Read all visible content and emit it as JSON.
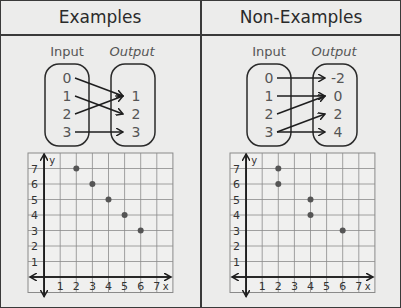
{
  "headers": {
    "left": "Examples",
    "right": "Non-Examples"
  },
  "mapping_labels": {
    "input": "Input",
    "output": "Output"
  },
  "examples": {
    "mapping": {
      "inputs": [
        "0",
        "1",
        "2",
        "3"
      ],
      "outputs": [
        "1",
        "2",
        "3"
      ],
      "arrows": [
        [
          "0",
          "1"
        ],
        [
          "1",
          "2"
        ],
        [
          "2",
          "1"
        ],
        [
          "3",
          "3"
        ]
      ]
    },
    "graph": {
      "x_ticks": [
        "1",
        "2",
        "3",
        "4",
        "5",
        "6",
        "7"
      ],
      "y_ticks": [
        "1",
        "2",
        "3",
        "4",
        "5",
        "6",
        "7"
      ],
      "x_label": "x",
      "y_label": "y",
      "points": [
        [
          2,
          7
        ],
        [
          3,
          6
        ],
        [
          4,
          5
        ],
        [
          5,
          4
        ],
        [
          6,
          3
        ]
      ]
    }
  },
  "non_examples": {
    "mapping": {
      "inputs": [
        "0",
        "1",
        "2",
        "3"
      ],
      "outputs": [
        "-2",
        "0",
        "2",
        "4"
      ],
      "arrows": [
        [
          "0",
          "-2"
        ],
        [
          "1",
          "0"
        ],
        [
          "2",
          "0"
        ],
        [
          "3",
          "2"
        ],
        [
          "3",
          "4"
        ]
      ]
    },
    "graph": {
      "x_ticks": [
        "1",
        "2",
        "3",
        "4",
        "5",
        "6",
        "7"
      ],
      "y_ticks": [
        "1",
        "2",
        "3",
        "4",
        "5",
        "6",
        "7"
      ],
      "x_label": "x",
      "y_label": "y",
      "points": [
        [
          2,
          7
        ],
        [
          2,
          6
        ],
        [
          4,
          5
        ],
        [
          4,
          4
        ],
        [
          6,
          3
        ]
      ]
    }
  },
  "chart_data": [
    {
      "type": "scatter",
      "title": "Examples",
      "xlabel": "x",
      "ylabel": "y",
      "xlim": [
        0,
        7
      ],
      "ylim": [
        0,
        7
      ],
      "grid": true,
      "x": [
        2,
        3,
        4,
        5,
        6
      ],
      "y": [
        7,
        6,
        5,
        4,
        3
      ]
    },
    {
      "type": "scatter",
      "title": "Non-Examples",
      "xlabel": "x",
      "ylabel": "y",
      "xlim": [
        0,
        7
      ],
      "ylim": [
        0,
        7
      ],
      "grid": true,
      "x": [
        2,
        2,
        4,
        4,
        6
      ],
      "y": [
        7,
        6,
        5,
        4,
        3
      ]
    }
  ]
}
